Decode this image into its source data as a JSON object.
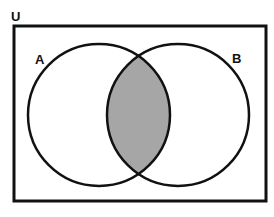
{
  "diagram": {
    "type": "venn",
    "universe_label": "U",
    "sets": [
      {
        "label": "A"
      },
      {
        "label": "B"
      }
    ],
    "shaded_region": "A ∩ B",
    "colors": {
      "stroke": "#111111",
      "shade": "#a6a6a6",
      "background": "#ffffff"
    }
  }
}
